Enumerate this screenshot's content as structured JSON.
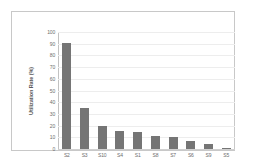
{
  "chart_data": {
    "type": "bar",
    "title": "",
    "subtitle": "",
    "xlabel": "",
    "ylabel": "Utilization Rate (%)",
    "categories": [
      "S2",
      "S3",
      "S10",
      "S4",
      "S1",
      "S8",
      "S7",
      "S6",
      "S9",
      "S5"
    ],
    "values": [
      91,
      35,
      20,
      15,
      14.5,
      11,
      10,
      7,
      4,
      1
    ],
    "series": [
      {
        "name": "Utilization Rate",
        "values": [
          91,
          35,
          20,
          15,
          14.5,
          11,
          10,
          7,
          4,
          1
        ]
      }
    ],
    "ylim": [
      0,
      100
    ],
    "y_ticks": [
      0,
      10,
      20,
      30,
      40,
      50,
      60,
      70,
      80,
      90,
      100
    ],
    "y_tick_labels": [
      "0",
      "10",
      "20",
      "30",
      "40",
      "50",
      "60",
      "70",
      "80",
      "90",
      "100"
    ],
    "grid": true,
    "grid_axis": "y",
    "legend": false,
    "legend_position": "none",
    "annotations": [],
    "colors": {
      "bar": "#757575",
      "gridline": "#ededed",
      "axis": "#c2c2c2",
      "tick_text": "#6d6d6d",
      "axis_title": "#5a5a5a",
      "plot_background": "#ffffff",
      "figure_border": "#c8c8c8"
    }
  }
}
